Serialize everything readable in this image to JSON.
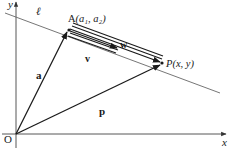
{
  "diagram": {
    "axes": {
      "x_label": "x",
      "y_label": "y",
      "origin_label": "O"
    },
    "line": {
      "label": "ℓ"
    },
    "points": {
      "A": {
        "name": "A",
        "coords": "(a₁, a₂)"
      },
      "P": {
        "name": "P",
        "coords": "(x, y)"
      }
    },
    "vectors": {
      "a": {
        "label": "a",
        "from": "O",
        "to": "A"
      },
      "p": {
        "label": "p",
        "from": "O",
        "to": "P"
      },
      "v": {
        "label": "v",
        "from": "A",
        "direction": "along ℓ"
      },
      "w": {
        "label": "w",
        "from": "A",
        "to": "P"
      }
    },
    "colors": {
      "ink": "#1a1a1a",
      "line": "#555555",
      "background": "#ffffff"
    }
  }
}
